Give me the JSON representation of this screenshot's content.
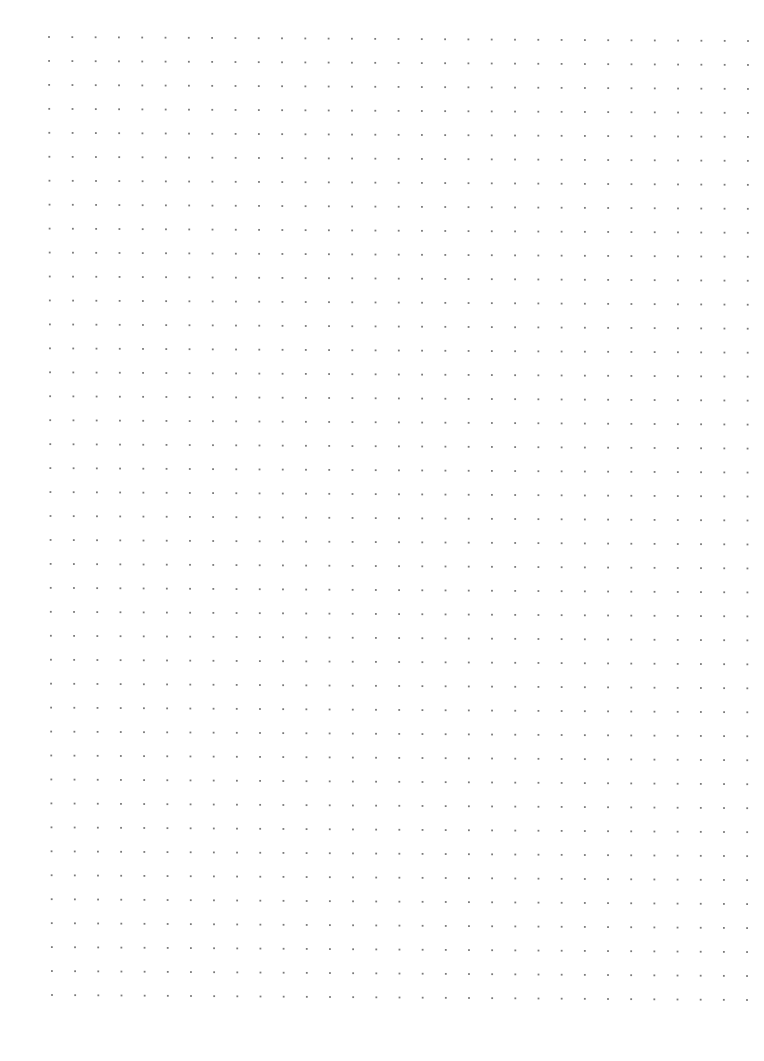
{
  "page": {
    "width": 764,
    "height": 1061,
    "background_color": "#ffffff"
  },
  "dot_grid": {
    "columns": 31,
    "rows": 41,
    "dot_color": "#7a7a7a",
    "dot_size": 1.8,
    "corners": {
      "top_left": [
        49,
        37
      ],
      "top_right": [
        748,
        41
      ],
      "bottom_left": [
        52,
        995
      ],
      "bottom_right": [
        747,
        1000
      ]
    }
  }
}
